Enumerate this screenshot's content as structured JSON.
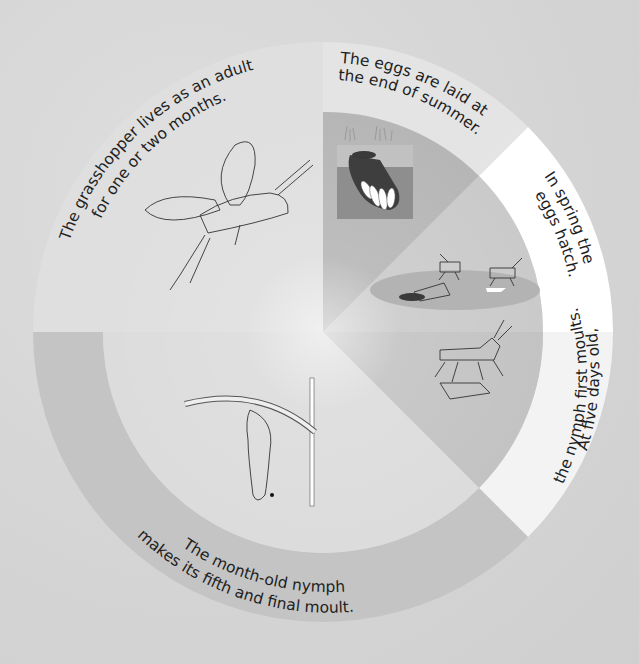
{
  "diagram": {
    "type": "life-cycle-wheel",
    "subject": "grasshopper",
    "colors": {
      "background": "#d6d6d6",
      "eggs_ring": "#e3e3e3",
      "eggs_inner": "#b6b6b6",
      "spring_ring": "#ffffff",
      "spring_inner": "#cacaca",
      "fivedays_ring": "#f2f2f2",
      "fivedays_inner": "#c2c2c2",
      "month_ring": "#c3c3c3",
      "month_inner": "#dcdcdc",
      "adult": "#dfdfdf",
      "soil": "#8c8c8c",
      "pod": "#404040"
    },
    "stages": [
      {
        "id": "eggs",
        "line1": "The eggs are laid at",
        "line2": "the end of summer."
      },
      {
        "id": "hatch",
        "line1": "In spring the",
        "line2": "eggs hatch."
      },
      {
        "id": "first-moult",
        "line1": "At five days old,",
        "line2": "the nymph first moults."
      },
      {
        "id": "final-moult",
        "line1": "The month-old nymph",
        "line2": "makes its fifth and final moult."
      },
      {
        "id": "adult",
        "line1": "The grasshopper lives as an adult",
        "line2": "for one or two months."
      }
    ]
  }
}
